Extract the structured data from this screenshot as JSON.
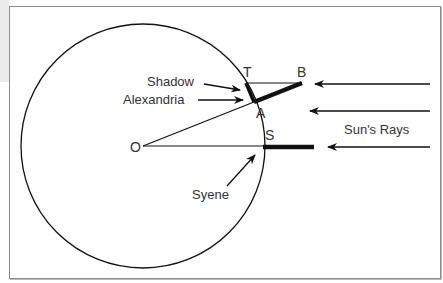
{
  "diagram": {
    "labels": {
      "center": "O",
      "top_of_gnomon": "T",
      "shadow_tip": "B",
      "alexandria_point": "A",
      "syene_point": "S",
      "shadow": "Shadow",
      "alexandria": "Alexandria",
      "syene": "Syene",
      "sun_rays": "Sun's Rays"
    },
    "colors": {
      "stroke": "#111111",
      "text": "#333333",
      "frame": "#8c8c8c",
      "panel": "#ececec"
    },
    "geometry": {
      "circle": {
        "cx": 143,
        "cy": 146,
        "r": 122
      },
      "points": {
        "O": [
          143,
          146
        ],
        "A": [
          254,
          102
        ],
        "T": [
          246,
          83
        ],
        "B": [
          302,
          83
        ],
        "S": [
          263,
          146
        ]
      }
    }
  }
}
